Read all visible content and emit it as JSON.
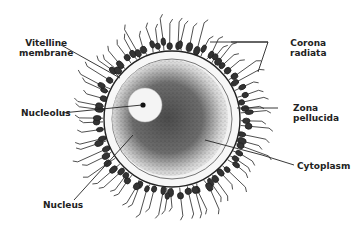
{
  "diagram": {
    "type": "anatomical illustration",
    "colors": {
      "ink": "#222222",
      "background": "#ffffff",
      "zona": "#f4f4f4",
      "cytoplasm_dense": "#3a3a3a"
    },
    "labels": {
      "vitelline_1": "Vitelline",
      "vitelline_2": "membrane",
      "nucleolus": "Nucleolus",
      "nucleus": "Nucleus",
      "corona_1": "Corona",
      "corona_2": "radiata",
      "zona_1": "Zona",
      "zona_2": "pellucida",
      "cytoplasm": "Cytoplasm"
    }
  }
}
